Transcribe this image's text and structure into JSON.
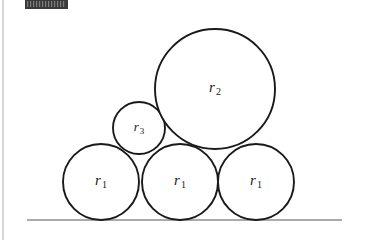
{
  "figure": {
    "background_color": "#ffffff",
    "stroke_color": "#1a1a1a",
    "ground_line_color": "#585858",
    "redaction_color": "#3a3a3a",
    "canvas": {
      "width": 371,
      "height": 245
    }
  },
  "redaction": {
    "name": "redacted-label-bar",
    "x": 25,
    "y": 0,
    "width": 43,
    "height": 9,
    "text": ""
  },
  "ground": {
    "name": "ground-line",
    "x1": 27,
    "y1": 220,
    "x2": 342,
    "y2": 220
  },
  "left_edge_rule": {
    "name": "left-edge-rule",
    "x1": 3,
    "y1": 0,
    "x2": 3,
    "y2": 240
  },
  "circles": [
    {
      "id": "circle-r1-left",
      "label_main": "r",
      "label_sub": "1",
      "label_full": "r1",
      "cx": 101,
      "cy": 182,
      "r": 38,
      "label_x": 101,
      "label_y": 182
    },
    {
      "id": "circle-r1-middle",
      "label_main": "r",
      "label_sub": "1",
      "label_full": "r1",
      "cx": 180,
      "cy": 182,
      "r": 38,
      "label_x": 180,
      "label_y": 182
    },
    {
      "id": "circle-r1-right",
      "label_main": "r",
      "label_sub": "1",
      "label_full": "r1",
      "cx": 256,
      "cy": 182,
      "r": 38,
      "label_x": 256,
      "label_y": 182
    },
    {
      "id": "circle-r3-small",
      "label_main": "r",
      "label_sub": "3",
      "label_full": "r3",
      "cx": 139,
      "cy": 128,
      "r": 26,
      "label_x": 139,
      "label_y": 128
    },
    {
      "id": "circle-r2-large",
      "label_main": "r",
      "label_sub": "2",
      "label_full": "r2",
      "cx": 215,
      "cy": 89,
      "r": 60,
      "label_x": 215,
      "label_y": 89
    }
  ]
}
